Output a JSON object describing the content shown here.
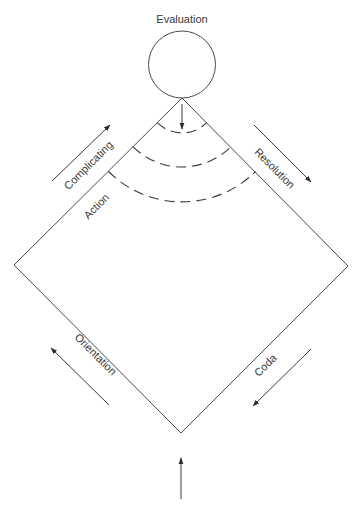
{
  "diagram": {
    "title": "Evaluation",
    "colors": {
      "line": "#4a4a4a",
      "text": "#3a3a3a",
      "background": "#ffffff"
    },
    "circle": {
      "label": "Evaluation",
      "cx": 182,
      "cy": 64.5,
      "r": 33.5
    },
    "diamond": {
      "top": [
        182,
        98
      ],
      "right": [
        348,
        266
      ],
      "bottom": [
        181,
        433
      ],
      "left": [
        14,
        265
      ]
    },
    "arcs": [
      {
        "name": "arc-1",
        "radius": 35
      },
      {
        "name": "arc-2",
        "radius": 69
      },
      {
        "name": "arc-3",
        "radius": 104
      }
    ],
    "labels": {
      "complicating": "Complicating",
      "action": "Action",
      "resolution": "Resolution",
      "orientation": "Orientation",
      "coda": "Coda"
    },
    "arrows": [
      {
        "name": "complicating-arrow",
        "from": [
          52,
          181
        ],
        "to": [
          110,
          125
        ]
      },
      {
        "name": "resolution-arrow",
        "from": [
          254,
          125
        ],
        "to": [
          311,
          182
        ]
      },
      {
        "name": "orientation-arrow",
        "from": [
          109,
          405
        ],
        "to": [
          51,
          348
        ]
      },
      {
        "name": "coda-arrow",
        "from": [
          311,
          349
        ],
        "to": [
          253,
          406
        ]
      },
      {
        "name": "entry-arrow",
        "from": [
          181,
          499
        ],
        "to": [
          181,
          458
        ]
      },
      {
        "name": "evaluation-arrow",
        "from": [
          182,
          104
        ],
        "to": [
          182,
          128
        ]
      }
    ]
  }
}
